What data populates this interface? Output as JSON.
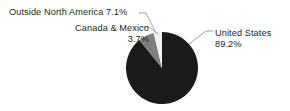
{
  "chart_data": {
    "type": "pie",
    "title": "",
    "subtitle": "",
    "xlabel": "",
    "ylabel": "",
    "grid": false,
    "legend_position": "callout-labels",
    "units": "percent",
    "start_angle_deg": 0,
    "direction": "clockwise",
    "categories": [
      "United States",
      "Outside North America",
      "Canada & Mexico"
    ],
    "values": [
      89.2,
      7.1,
      3.7
    ],
    "slices": [
      {
        "name": "United States",
        "value": 89.2,
        "value_label": "89.2%",
        "color": "#1a1a1a"
      },
      {
        "name": "Outside North America",
        "value": 7.1,
        "value_label": "7.1%",
        "color": "#7f7f7f"
      },
      {
        "name": "Canada & Mexico",
        "value": 3.7,
        "value_label": "3.7%",
        "color": "#f0f0f0"
      }
    ],
    "annotations": [
      {
        "text": "Outside North America 7.1%",
        "target": "Outside North America"
      },
      {
        "text": "Canada & Mexico 3.7%",
        "target": "Canada & Mexico"
      },
      {
        "text": "United States 89.2%",
        "target": "United States"
      }
    ]
  },
  "labels": {
    "outside_north_america": "Outside North America 7.1%",
    "canada_mexico_name": "Canada & Mexico",
    "canada_mexico_value": "3.7%",
    "united_states_name": "United States",
    "united_states_value": "89.2%"
  },
  "colors": {
    "background": "#ffffff",
    "text": "#231f20",
    "leader_line": "#8c8c8c",
    "slice_united_states": "#1a1a1a",
    "slice_outside_north_america": "#7f7f7f",
    "slice_canada_mexico": "#f0f0f0"
  }
}
